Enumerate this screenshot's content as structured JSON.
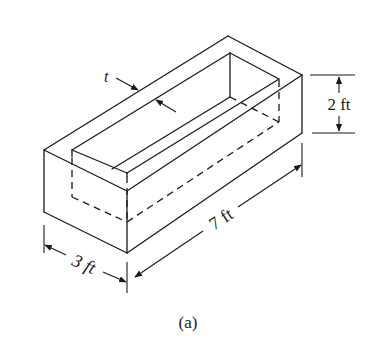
{
  "figure": {
    "caption": "(a)",
    "dimensions": {
      "thickness_label": "t",
      "height_label": "2 ft",
      "length_label": "7 ft",
      "width_label": "3 ft"
    },
    "colors": {
      "line": "#1a1a1a",
      "background": "#ffffff"
    }
  }
}
